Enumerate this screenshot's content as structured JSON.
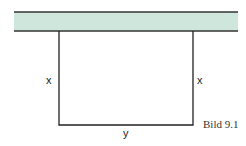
{
  "diagram": {
    "wall": {
      "fill": "#cfe6dc",
      "stroke": "#333333"
    },
    "labels": {
      "left_side": "x",
      "right_side": "x",
      "bottom_side": "y"
    },
    "caption": "Bild 9.1"
  }
}
